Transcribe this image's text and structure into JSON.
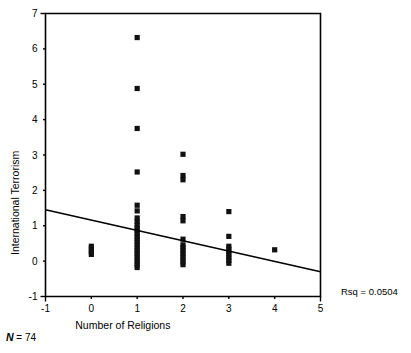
{
  "chart_data": {
    "type": "scatter",
    "title": "",
    "xlabel": "Number of Religions",
    "ylabel": "International Terrorism",
    "xlim": [
      -1,
      5
    ],
    "ylim": [
      -1,
      7
    ],
    "xticks": [
      "-1",
      "0",
      "1",
      "2",
      "3",
      "4",
      "5"
    ],
    "xtick_values": [
      -1,
      0,
      1,
      2,
      3,
      4,
      5
    ],
    "yticks": [
      "-1",
      "0",
      "1",
      "2",
      "3",
      "4",
      "5",
      "6",
      "7"
    ],
    "ytick_values": [
      -1,
      0,
      1,
      2,
      3,
      4,
      5,
      6,
      7
    ],
    "grid": false,
    "legend": null,
    "marker": "square",
    "marker_color": "#111111",
    "points": [
      {
        "x": 0,
        "y": 0.42
      },
      {
        "x": 0,
        "y": 0.34
      },
      {
        "x": 0,
        "y": 0.26
      },
      {
        "x": 0,
        "y": 0.19
      },
      {
        "x": 1,
        "y": 6.32
      },
      {
        "x": 1,
        "y": 4.88
      },
      {
        "x": 1,
        "y": 3.75
      },
      {
        "x": 1,
        "y": 2.52
      },
      {
        "x": 1,
        "y": 1.58
      },
      {
        "x": 1,
        "y": 1.42
      },
      {
        "x": 1,
        "y": 1.22
      },
      {
        "x": 1,
        "y": 1.12
      },
      {
        "x": 1,
        "y": 1.02
      },
      {
        "x": 1,
        "y": 0.94
      },
      {
        "x": 1,
        "y": 0.86
      },
      {
        "x": 1,
        "y": 0.78
      },
      {
        "x": 1,
        "y": 0.7
      },
      {
        "x": 1,
        "y": 0.62
      },
      {
        "x": 1,
        "y": 0.54
      },
      {
        "x": 1,
        "y": 0.46
      },
      {
        "x": 1,
        "y": 0.38
      },
      {
        "x": 1,
        "y": 0.3
      },
      {
        "x": 1,
        "y": 0.22
      },
      {
        "x": 1,
        "y": 0.14
      },
      {
        "x": 1,
        "y": 0.06
      },
      {
        "x": 1,
        "y": -0.02
      },
      {
        "x": 1,
        "y": -0.1
      },
      {
        "x": 1,
        "y": -0.18
      },
      {
        "x": 2,
        "y": 3.02
      },
      {
        "x": 2,
        "y": 2.42
      },
      {
        "x": 2,
        "y": 2.3
      },
      {
        "x": 2,
        "y": 1.26
      },
      {
        "x": 2,
        "y": 1.14
      },
      {
        "x": 2,
        "y": 0.62
      },
      {
        "x": 2,
        "y": 0.46
      },
      {
        "x": 2,
        "y": 0.38
      },
      {
        "x": 2,
        "y": 0.3
      },
      {
        "x": 2,
        "y": 0.22
      },
      {
        "x": 2,
        "y": 0.14
      },
      {
        "x": 2,
        "y": 0.06
      },
      {
        "x": 2,
        "y": -0.02
      },
      {
        "x": 2,
        "y": -0.1
      },
      {
        "x": 3,
        "y": 1.4
      },
      {
        "x": 3,
        "y": 0.7
      },
      {
        "x": 3,
        "y": 0.42
      },
      {
        "x": 3,
        "y": 0.34
      },
      {
        "x": 3,
        "y": 0.26
      },
      {
        "x": 3,
        "y": 0.18
      },
      {
        "x": 3,
        "y": 0.1
      },
      {
        "x": 3,
        "y": 0.02
      },
      {
        "x": 3,
        "y": -0.06
      },
      {
        "x": 4,
        "y": 0.32
      }
    ],
    "fit_line": {
      "x_start": -1,
      "y_start": 1.45,
      "x_end": 5,
      "y_end": -0.3
    },
    "annotations": [
      {
        "name": "rsq",
        "text": "Rsq = 0.0504"
      },
      {
        "name": "sample-size",
        "prefix": "N",
        "equals": " = ",
        "value": "74"
      }
    ]
  }
}
